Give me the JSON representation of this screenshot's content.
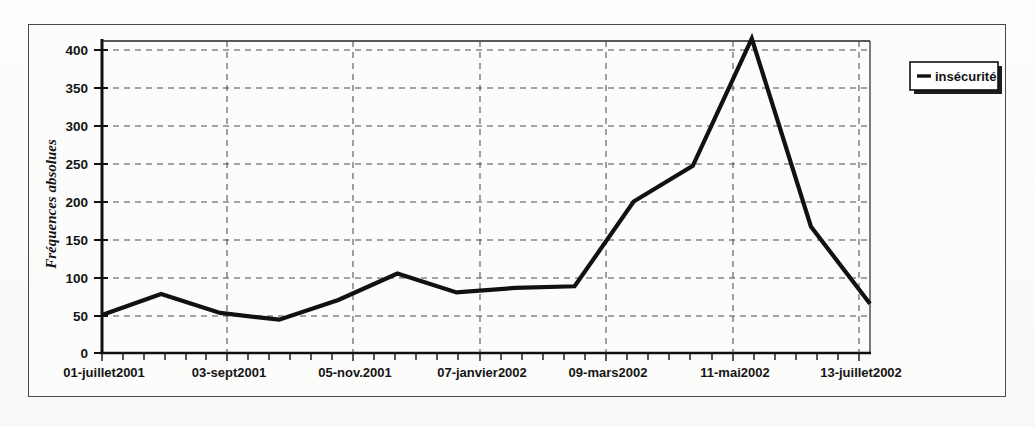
{
  "chart_data": {
    "type": "line",
    "title": "",
    "xlabel": "",
    "ylabel": "Fréquences absolues",
    "ylim": [
      0,
      420
    ],
    "yticks": [
      0,
      50,
      100,
      150,
      200,
      250,
      300,
      350,
      400
    ],
    "grid": true,
    "legend_position": "right",
    "x_tick_labels": [
      "01-juillet2001",
      "03-sept2001",
      "05-nov.2001",
      "07-janvier2002",
      "09-mars2002",
      "11-mai2002",
      "13-juillet2002"
    ],
    "series": [
      {
        "name": "insécurité",
        "color": "#111111",
        "values": [
          50,
          78,
          53,
          44,
          70,
          105,
          80,
          86,
          88,
          200,
          247,
          415,
          167,
          65
        ]
      }
    ],
    "x": [
      "01-juillet2001",
      "",
      "03-sept2001",
      "",
      "",
      "",
      "07-janvier2002",
      "",
      "",
      "09-mars2002",
      "",
      "11-mai2002",
      "",
      "13-juillet2002"
    ]
  },
  "legend": {
    "entries": [
      {
        "label": "insécurité",
        "marker": "line-marker"
      }
    ]
  },
  "axes": {
    "y_label": "Fréquences absolues",
    "y_ticks": [
      "400",
      "350",
      "300",
      "250",
      "200",
      "150",
      "100",
      "50",
      "0"
    ],
    "x_ticks": [
      "01-juillet2001",
      "03-sept2001",
      "05-nov.2001",
      "07-janvier2002",
      "09-mars2002",
      "11-mai2002",
      "13-juillet2002"
    ]
  },
  "colors": {
    "line": "#111111",
    "grid": "#555555",
    "axis": "#111111",
    "frame": "#4a4a4a",
    "background": "#fcfcfa"
  }
}
